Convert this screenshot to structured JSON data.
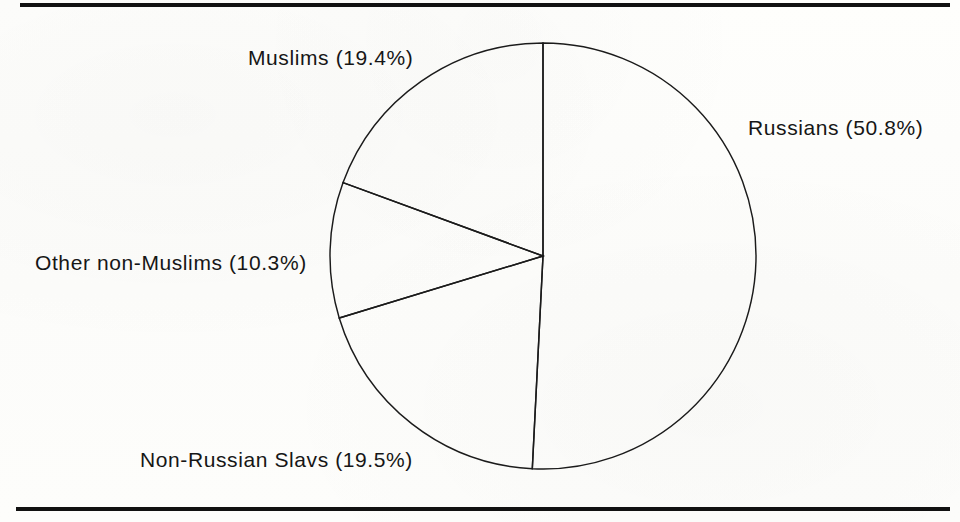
{
  "figure": {
    "background_color": "#fdfdfb",
    "line_color": "#1b1b1b",
    "rule_color": "#111111"
  },
  "chart_data": {
    "type": "pie",
    "title": "",
    "subtitle": "",
    "xlabel": "",
    "ylabel": "",
    "grid": false,
    "legend_position": "none",
    "label_style": "outside-callout",
    "start_angle_deg": 90,
    "direction": "clockwise",
    "categories": [
      "Russians",
      "Non-Russian Slavs",
      "Other non-Muslims",
      "Muslims"
    ],
    "values": [
      50.8,
      19.5,
      10.3,
      19.4
    ],
    "unit": "%",
    "slices": [
      {
        "name": "Russians",
        "label": "Russians (50.8%)",
        "value": 50.8,
        "angle_deg": 182.9,
        "fill": "none",
        "stroke": "#1b1b1b"
      },
      {
        "name": "Non-Russian Slavs",
        "label": "Non-Russian Slavs (19.5%)",
        "value": 19.5,
        "angle_deg": 70.2,
        "fill": "none",
        "stroke": "#1b1b1b"
      },
      {
        "name": "Other non-Muslims",
        "label": "Other non-Muslims (10.3%)",
        "value": 10.3,
        "angle_deg": 37.1,
        "fill": "none",
        "stroke": "#1b1b1b"
      },
      {
        "name": "Muslims",
        "label": "Muslims (19.4%)",
        "value": 19.4,
        "angle_deg": 69.8,
        "fill": "none",
        "stroke": "#1b1b1b"
      }
    ],
    "geometry": {
      "center_x": 543,
      "center_y": 256,
      "radius": 213
    }
  }
}
